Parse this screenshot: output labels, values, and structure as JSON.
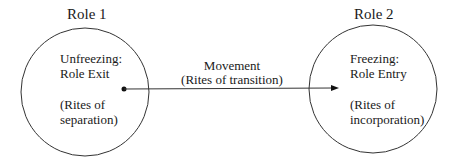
{
  "diagram": {
    "role1": {
      "title": "Role 1",
      "line1": "Unfreezing:",
      "line2": "Role Exit",
      "line3": "(Rites of",
      "line4": "separation)"
    },
    "role2": {
      "title": "Role 2",
      "line1": "Freezing:",
      "line2": "Role Entry",
      "line3": "(Rites of",
      "line4": "incorporation)"
    },
    "movement": {
      "line1": "Movement",
      "line2": "(Rites of transition)"
    },
    "colors": {
      "stroke": "#333333",
      "text": "#1a1a1a",
      "background": "#ffffff"
    }
  }
}
